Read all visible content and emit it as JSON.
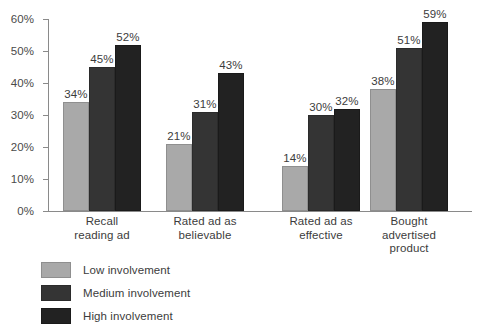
{
  "chart_data": {
    "type": "bar",
    "title": "",
    "subtitle": "",
    "xlabel": "",
    "ylabel": "",
    "ylim": [
      0,
      60
    ],
    "grid": false,
    "legend_position": "bottom-left",
    "ytick_labels": [
      "0%",
      "10%",
      "20%",
      "30%",
      "40%",
      "50%",
      "60%"
    ],
    "ytick_values": [
      0,
      10,
      20,
      30,
      40,
      50,
      60
    ],
    "categories": [
      "Recall\nreading ad",
      "Rated ad as\nbelievable",
      "Rated ad as\neffective",
      "Bought\nadvertised\nproduct"
    ],
    "series": [
      {
        "name": "Low involvement",
        "color": "#a9a9a9",
        "values": [
          34,
          21,
          14,
          38
        ],
        "labels": [
          "34%",
          "21%",
          "14%",
          "38%"
        ]
      },
      {
        "name": "Medium involvement",
        "color": "#343434",
        "values": [
          45,
          31,
          30,
          51
        ],
        "labels": [
          "45%",
          "31%",
          "30%",
          "51%"
        ]
      },
      {
        "name": "High involvement",
        "color": "#222222",
        "values": [
          52,
          43,
          32,
          59
        ],
        "labels": [
          "52%",
          "43%",
          "32%",
          "59%"
        ]
      }
    ]
  }
}
